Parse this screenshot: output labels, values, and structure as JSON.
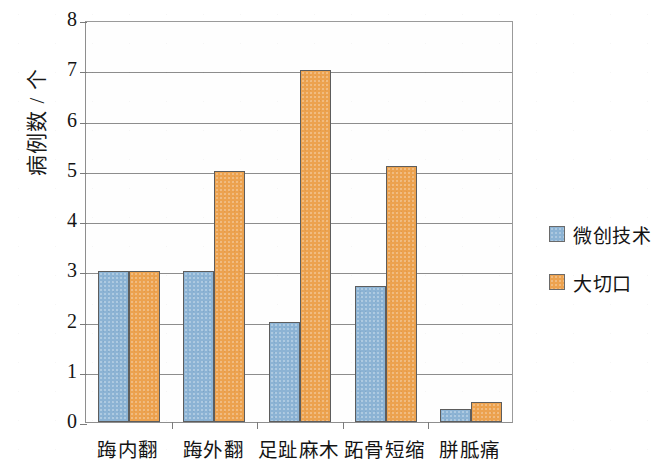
{
  "chart_data": {
    "type": "bar",
    "title": "",
    "xlabel": "",
    "ylabel": "病例数 / 个",
    "categories": [
      "踇内翻",
      "踇外翻",
      "足趾麻木",
      "跖骨短缩",
      "胼胝痛"
    ],
    "series": [
      {
        "name": "微创技术",
        "color": "#8cb3d4",
        "values": [
          3,
          3,
          2,
          2.7,
          0.25
        ]
      },
      {
        "name": "大切口",
        "color": "#eca24f",
        "values": [
          3,
          5,
          7,
          5.1,
          0.4
        ]
      }
    ],
    "ylim": [
      0,
      8
    ],
    "ytick_labels": [
      "8",
      "7",
      "6",
      "5",
      "4",
      "3",
      "2",
      "1",
      "0"
    ],
    "ytick_values": [
      8,
      7,
      6,
      5,
      4,
      3,
      2,
      1,
      0
    ],
    "grid": true,
    "grid_axis": "y",
    "legend_position": "right"
  }
}
